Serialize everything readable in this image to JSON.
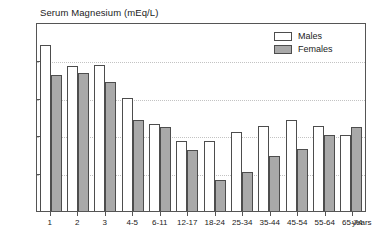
{
  "chart_data": {
    "type": "bar",
    "title": "Serum Magnesium (mEq/L)",
    "xlabel": "years",
    "ylabel": "",
    "ylim": [
      1.6,
      1.85
    ],
    "yticks": [
      1.6,
      1.65,
      1.7,
      1.75,
      1.8,
      1.85
    ],
    "ytick_labels": [
      "1.60",
      "1.65",
      "1.70",
      "1.75",
      "1.80",
      "1.85"
    ],
    "grid": true,
    "legend_position": "top-right",
    "categories": [
      "1",
      "2",
      "3",
      "4-5",
      "6-11",
      "12-17",
      "18-24",
      "25-34",
      "35-44",
      "45-54",
      "55-64",
      "65-74"
    ],
    "series": [
      {
        "name": "Males",
        "color": "#ffffff",
        "values": [
          1.82,
          1.792,
          1.793,
          1.75,
          1.715,
          1.692,
          1.692,
          1.705,
          1.712,
          1.721,
          1.712,
          1.701
        ]
      },
      {
        "name": "Females",
        "color": "#a9a9a9",
        "values": [
          1.78,
          1.783,
          1.77,
          1.721,
          1.711,
          1.681,
          1.641,
          1.651,
          1.673,
          1.682,
          1.701,
          1.711
        ]
      }
    ]
  },
  "axis": {
    "unit_label": "years"
  }
}
